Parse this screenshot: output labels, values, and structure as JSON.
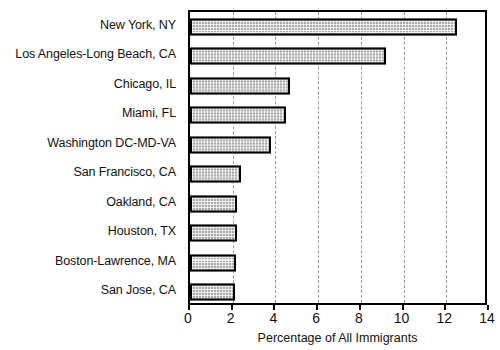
{
  "chart_data": {
    "type": "bar",
    "orientation": "horizontal",
    "title": "",
    "xlabel": "Percentage of All Immigrants",
    "ylabel": "",
    "xlim": [
      0,
      14
    ],
    "xticks": [
      0,
      2,
      4,
      6,
      8,
      10,
      12,
      14
    ],
    "grid": "vertical-dashed",
    "legend": "none",
    "categories": [
      "New York, NY",
      "Los Angeles-Long Beach, CA",
      "Chicago, IL",
      "Miami, FL",
      "Washington DC-MD-VA",
      "San Francisco, CA",
      "Oakland, CA",
      "Houston, TX",
      "Boston-Lawrence, MA",
      "San Jose, CA"
    ],
    "values": [
      12.5,
      9.2,
      4.7,
      4.5,
      3.8,
      2.4,
      2.2,
      2.2,
      2.15,
      2.1
    ],
    "bar_fill_color": "#a9a9a9",
    "bar_edge_color": "#000000"
  },
  "axis": {
    "x_title": "Percentage of All Immigrants",
    "tick_labels": [
      "0",
      "2",
      "4",
      "6",
      "8",
      "10",
      "12",
      "14"
    ]
  }
}
